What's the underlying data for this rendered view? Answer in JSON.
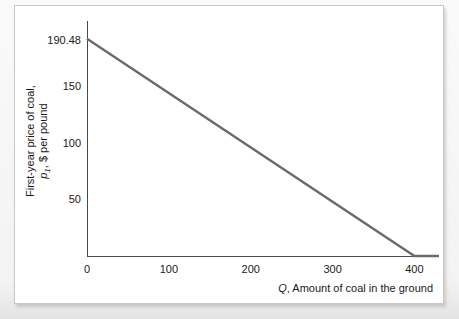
{
  "chart_data": {
    "type": "line",
    "title": "",
    "xlabel": "Q, Amount of coal in the ground",
    "xlabel_symbol": "Q",
    "xlabel_rest": ", Amount of coal in the ground",
    "ylabel_line1": "First-year price of coal,",
    "ylabel_symbol": "p",
    "ylabel_subscript": "1",
    "ylabel_line2_rest": ", $ per pound",
    "xticks": [
      0,
      100,
      200,
      300,
      400
    ],
    "xtick_labels": [
      "0",
      "100",
      "200",
      "300",
      "400"
    ],
    "yticks": [
      50,
      100,
      150,
      190.48
    ],
    "ytick_labels": [
      "50",
      "100",
      "150",
      "190.48"
    ],
    "xlim": [
      0,
      430
    ],
    "ylim": [
      0,
      207
    ],
    "grid": false,
    "legend": false,
    "series": [
      {
        "name": "First-year demand for coal",
        "color": "#6b6b6b",
        "points": [
          {
            "x": 0,
            "y": 190.48
          },
          {
            "x": 400,
            "y": 0
          },
          {
            "x": 430,
            "y": 0
          }
        ]
      }
    ],
    "intercept_y": 190.48,
    "intercept_x": 400,
    "slope": -0.4762
  },
  "colors": {
    "line": "#6b6b6b",
    "axis": "#4a4a4a",
    "panel_bg": "#ffffff",
    "page_bg": "#f1f1f1",
    "text": "#1a1a1a"
  }
}
